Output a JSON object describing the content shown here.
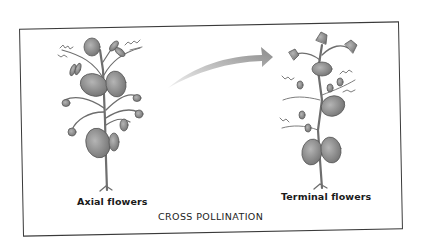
{
  "figure": {
    "caption": "CROSS POLLINATION",
    "left_plant": {
      "label": "Axial flowers",
      "icon": "axial-flowering-plant-illustration"
    },
    "right_plant": {
      "label": "Terminal flowers",
      "icon": "terminal-flowering-plant-illustration"
    },
    "arrow": {
      "icon": "curved-arrow-icon",
      "direction": "left-to-right"
    },
    "colors": {
      "frame": "#3a3a3a",
      "arrow": "#9a9a9a",
      "leaf": "#8c8c8c",
      "stem": "#6e6e6e",
      "text": "#1a1a1a"
    }
  }
}
